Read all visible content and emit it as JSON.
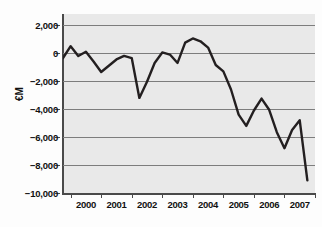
{
  "chart_data": {
    "type": "line",
    "title": "",
    "xlabel": "",
    "ylabel": "€M",
    "ylim": [
      -10000,
      2800
    ],
    "xlim": [
      1999.75,
      2008.0
    ],
    "grid": true,
    "legend": "none",
    "y_ticks": [
      2000,
      0,
      -2000,
      -4000,
      -6000,
      -8000,
      -10000
    ],
    "y_tick_labels": [
      "2,000",
      "0",
      "−2,000",
      "−4,000",
      "−6,000",
      "−8,000",
      "−10,000"
    ],
    "x_ticks": [
      2000,
      2001,
      2002,
      2003,
      2004,
      2005,
      2006,
      2007
    ],
    "x_tick_labels": [
      "2000",
      "2001",
      "2002",
      "2003",
      "2004",
      "2005",
      "2006",
      "2007"
    ],
    "series": [
      {
        "name": "€M",
        "color": "#231f20",
        "x": [
          1999.75,
          2000.0,
          2000.25,
          2000.5,
          2000.75,
          2001.0,
          2001.25,
          2001.5,
          2001.75,
          2002.0,
          2002.25,
          2002.5,
          2002.75,
          2003.0,
          2003.25,
          2003.5,
          2003.75,
          2004.0,
          2004.25,
          2004.5,
          2004.75,
          2005.0,
          2005.25,
          2005.5,
          2005.75,
          2006.0,
          2006.25,
          2006.5,
          2006.75,
          2007.0,
          2007.25,
          2007.5,
          2007.75
        ],
        "values": [
          -350,
          500,
          -200,
          100,
          -600,
          -1350,
          -900,
          -450,
          -200,
          -350,
          -3200,
          -2050,
          -700,
          50,
          -100,
          -700,
          750,
          1050,
          850,
          400,
          -850,
          -1300,
          -2600,
          -4400,
          -5200,
          -4100,
          -3250,
          -4050,
          -5650,
          -6800,
          -5500,
          -4800,
          -9100
        ]
      }
    ]
  },
  "axis": {
    "ylabel": "€M"
  }
}
